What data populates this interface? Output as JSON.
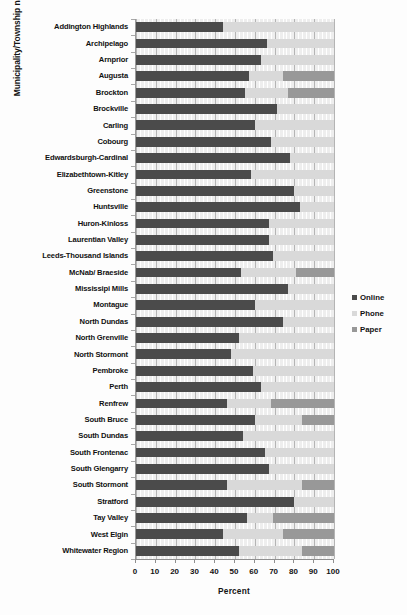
{
  "chart_data": {
    "type": "bar",
    "subtype": "stacked-horizontal-bar",
    "title": "",
    "xlabel": "Percent",
    "ylabel": "Municipality/Township name",
    "xlim": [
      0,
      100
    ],
    "xticks": [
      0,
      10,
      20,
      30,
      40,
      50,
      60,
      70,
      80,
      90,
      100
    ],
    "grid": true,
    "legend_position": "right",
    "legend": [
      "Online",
      "Phone",
      "Paper"
    ],
    "colors": {
      "Online": "#4b4b4b",
      "Phone": "#d9d9d9",
      "Paper": "#989898",
      "gridline": "#b4b4b4",
      "axis": "#8f8f8f",
      "background": "#fdfdfd"
    },
    "categories": [
      "Addington Highlands",
      "Archipelago",
      "Arnprior",
      "Augusta",
      "Brockton",
      "Brockville",
      "Carling",
      "Cobourg",
      "Edwardsburgh-Cardinal",
      "Elizabethtown-Kitley",
      "Greenstone",
      "Huntsville",
      "Huron-Kinloss",
      "Laurentian Valley",
      "Leeds-Thousand Islands",
      "McNab/ Braeside",
      "Mississipi Mills",
      "Montague",
      "North Dundas",
      "North Grenville",
      "North Stormont",
      "Pembroke",
      "Perth",
      "Renfrew",
      "South Bruce",
      "South Dundas",
      "South Frontenac",
      "South Glengarry",
      "South Stormont",
      "Stratford",
      "Tay Valley",
      "West Elgin",
      "Whitewater Region"
    ],
    "series": [
      {
        "name": "Online",
        "values": [
          44,
          66,
          63,
          57,
          55,
          71,
          60,
          68,
          78,
          58,
          80,
          83,
          67,
          67,
          69,
          53,
          77,
          60,
          74,
          52,
          48,
          59,
          63,
          46,
          60,
          54,
          65,
          67,
          46,
          80,
          56,
          44,
          52
        ]
      },
      {
        "name": "Phone",
        "values": [
          56,
          34,
          37,
          17,
          22,
          29,
          40,
          32,
          22,
          42,
          20,
          17,
          33,
          33,
          31,
          28,
          23,
          40,
          26,
          48,
          52,
          41,
          37,
          22,
          24,
          46,
          35,
          33,
          38,
          20,
          13,
          30,
          32
        ]
      },
      {
        "name": "Paper",
        "values": [
          0,
          0,
          0,
          26,
          23,
          0,
          0,
          0,
          0,
          0,
          0,
          0,
          0,
          0,
          0,
          19,
          0,
          0,
          0,
          0,
          0,
          0,
          0,
          32,
          16,
          0,
          0,
          0,
          16,
          0,
          31,
          26,
          16
        ]
      }
    ]
  },
  "legend": {
    "items": [
      {
        "label": "Online",
        "color": "#4b4b4b"
      },
      {
        "label": "Phone",
        "color": "#d9d9d9"
      },
      {
        "label": "Paper",
        "color": "#989898"
      }
    ]
  },
  "axes": {
    "x_title": "Percent",
    "y_title": "Municipality/Township name",
    "x_tick_labels": [
      "0",
      "10",
      "20",
      "30",
      "40",
      "50",
      "60",
      "70",
      "80",
      "90",
      "100"
    ]
  }
}
